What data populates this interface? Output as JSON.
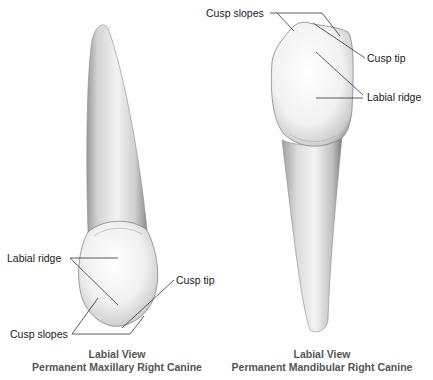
{
  "figure": {
    "left_panel": {
      "tooth": "maxillary-canine",
      "caption_line1": "Labial View",
      "caption_line2": "Permanent Maxillary Right Canine",
      "labels": {
        "labial_ridge": "Labial ridge",
        "cusp_tip": "Cusp tip",
        "cusp_slopes": "Cusp slopes"
      }
    },
    "right_panel": {
      "tooth": "mandibular-canine",
      "caption_line1": "Labial View",
      "caption_line2": "Permanent Mandibular Right Canine",
      "labels": {
        "cusp_slopes": "Cusp slopes",
        "cusp_tip": "Cusp tip",
        "labial_ridge": "Labial ridge"
      }
    },
    "colors": {
      "background": "#ffffff",
      "label_text": "#1a1a1a",
      "caption_text": "#555555",
      "leader_line": "#333333",
      "tooth_light": "#f7f7f7",
      "tooth_shadow": "#8a8a8a"
    }
  }
}
